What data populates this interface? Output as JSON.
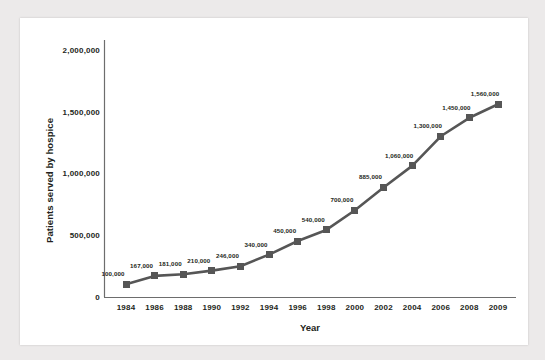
{
  "chart_data": {
    "type": "line",
    "title": "",
    "xlabel": "Year",
    "ylabel": "Patients served by hospice",
    "grid": false,
    "legend": "none",
    "categories": [
      "1984",
      "1986",
      "1988",
      "1990",
      "1992",
      "1994",
      "1996",
      "1998",
      "2000",
      "2002",
      "2004",
      "2006",
      "2008",
      "2009"
    ],
    "values": [
      100000,
      167000,
      181000,
      210000,
      246000,
      340000,
      450000,
      540000,
      700000,
      885000,
      1060000,
      1300000,
      1450000,
      1560000
    ],
    "point_labels": [
      "100,000",
      "167,000",
      "181,000",
      "210,000",
      "246,000",
      "340,000",
      "450,000",
      "540,000",
      "700,000",
      "885,000",
      "1,060,000",
      "1,300,000",
      "1,450,000",
      "1,560,000"
    ],
    "ylim": [
      0,
      2000000
    ],
    "y_ticks": [
      0,
      500000,
      1000000,
      1500000,
      2000000
    ],
    "y_tick_labels": [
      "0",
      "500,000",
      "1,000,000",
      "1,500,000",
      "2,000,000"
    ],
    "series_color": "#565656",
    "text_color": "#231f20",
    "axis_color": "#6d6d6d",
    "plot_background": "#ffffff",
    "page_background": "#eceaea"
  }
}
